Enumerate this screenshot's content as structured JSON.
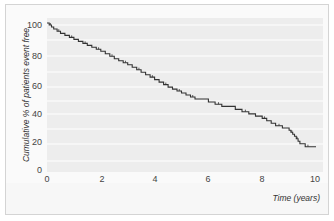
{
  "chart_data": {
    "type": "line",
    "subtype": "kaplan-meier step curve",
    "title": "",
    "xlabel": "Time (years)",
    "ylabel": "Cumulative % of patients event free",
    "xlim": [
      0,
      10
    ],
    "ylim": [
      0,
      100
    ],
    "x_ticks": [
      "0",
      "2",
      "4",
      "6",
      "8",
      "10"
    ],
    "y_ticks": [
      "0",
      "20",
      "40",
      "60",
      "80",
      "100"
    ],
    "grid": true,
    "legend": null,
    "series": [
      {
        "name": "Event-free survival",
        "x": [
          0,
          0.25,
          0.5,
          1.0,
          1.5,
          2.0,
          2.5,
          3.0,
          3.5,
          4.0,
          4.5,
          5.0,
          5.5,
          6.0,
          6.5,
          7.0,
          7.5,
          8.0,
          8.5,
          9.0,
          9.2,
          9.4,
          9.6,
          9.8
        ],
        "y": [
          100,
          96,
          93,
          89,
          85,
          81,
          76,
          72,
          67,
          62,
          57,
          53,
          49,
          47,
          44,
          42,
          39,
          36,
          31,
          28,
          24,
          19,
          17,
          17
        ]
      }
    ]
  },
  "axes": {
    "xlabel": "Time (years)",
    "ylabel": "Cumulative % of patients event free",
    "x_ticks": [
      "0",
      "2",
      "4",
      "6",
      "8",
      "10"
    ],
    "y_ticks": [
      "100",
      "80",
      "60",
      "40",
      "20",
      "0"
    ]
  },
  "colors": {
    "curve": "#333333",
    "plot_background": "#ededed",
    "gridline": "#ffffff"
  }
}
